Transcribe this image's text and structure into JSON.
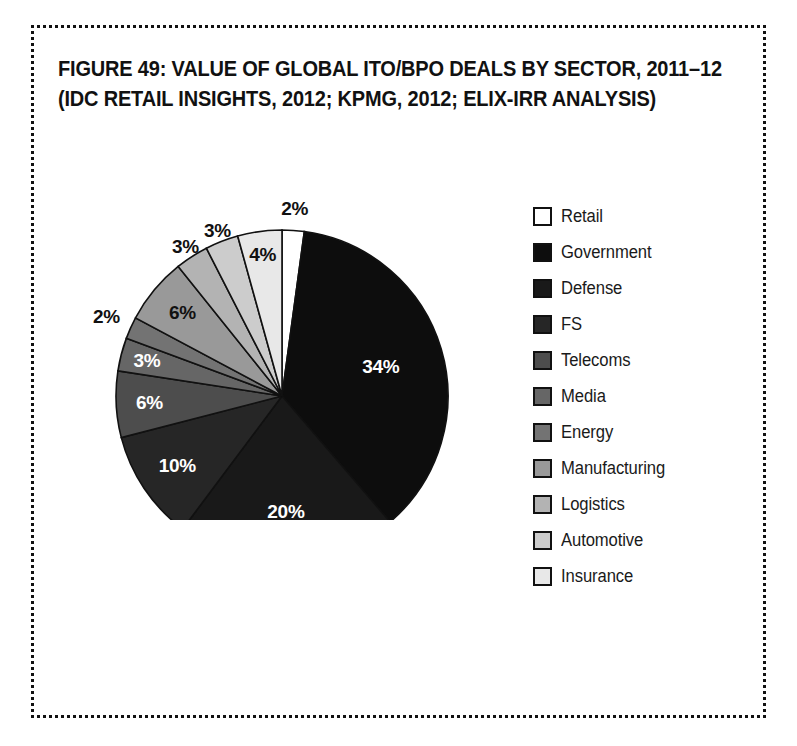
{
  "figure": {
    "title_line1": "FIGURE 49: VALUE OF GLOBAL ITO/BPO DEALS BY SECTOR, 2011–12",
    "title_line2": "(IDC RETAIL INSIGHTS, 2012; KPMG, 2012; ELIX-IRR ANALYSIS)"
  },
  "chart_data": {
    "type": "pie",
    "title": "FIGURE 49: VALUE OF GLOBAL ITO/BPO DEALS BY SECTOR, 2011–12 (IDC RETAIL INSIGHTS, 2012; KPMG, 2012; ELIX-IRR ANALYSIS)",
    "xlabel": "",
    "ylabel": "",
    "units": "percent",
    "legend_position": "right",
    "grid": false,
    "start_angle_deg": 0,
    "direction": "clockwise",
    "categories": [
      "Retail",
      "Government",
      "Defense",
      "FS",
      "Telecoms",
      "Media",
      "Energy",
      "Manufacturing",
      "Logistics",
      "Automotive",
      "Insurance"
    ],
    "values": [
      2,
      34,
      20,
      10,
      6,
      3,
      2,
      6,
      3,
      3,
      4
    ],
    "labels": [
      "2%",
      "34%",
      "20%",
      "10%",
      "6%",
      "3%",
      "2%",
      "6%",
      "3%",
      "3%",
      "4%"
    ],
    "colors": [
      "#ffffff",
      "#0d0d0d",
      "#191919",
      "#262626",
      "#4d4d4d",
      "#666666",
      "#737373",
      "#999999",
      "#b3b3b3",
      "#cccccc",
      "#e8e8e8"
    ],
    "label_text_colors": [
      "#111111",
      "#ffffff",
      "#ffffff",
      "#ffffff",
      "#ffffff",
      "#ffffff",
      "#111111",
      "#111111",
      "#111111",
      "#111111",
      "#111111"
    ]
  },
  "legend": {
    "items": [
      {
        "label": "Retail",
        "color": "#ffffff"
      },
      {
        "label": "Government",
        "color": "#0d0d0d"
      },
      {
        "label": "Defense",
        "color": "#191919"
      },
      {
        "label": "FS",
        "color": "#262626"
      },
      {
        "label": "Telecoms",
        "color": "#4d4d4d"
      },
      {
        "label": "Media",
        "color": "#666666"
      },
      {
        "label": "Energy",
        "color": "#737373"
      },
      {
        "label": "Manufacturing",
        "color": "#999999"
      },
      {
        "label": "Logistics",
        "color": "#b3b3b3"
      },
      {
        "label": "Automotive",
        "color": "#cccccc"
      },
      {
        "label": "Insurance",
        "color": "#e8e8e8"
      }
    ]
  }
}
